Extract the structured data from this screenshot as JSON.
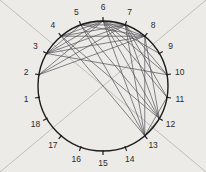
{
  "figure": {
    "title": "",
    "type": "circular-chord-diagram",
    "background_color": "#ecebe7",
    "circle": {
      "cx": 103,
      "cy": 86,
      "r": 65,
      "stroke": "#1c1c1c",
      "stroke_width": 1.4
    },
    "tick": {
      "length": 4,
      "stroke": "#1c1c1c",
      "stroke_width": 1.2
    },
    "label_radius": 78,
    "label_color": "#2a2a2a",
    "chord_color": "#4a4a52",
    "chord_width": 0.8,
    "guide_color": "#b9b8b4",
    "guide_width": 0.9,
    "node_count": 18
  },
  "chart_data": {
    "type": "scatter",
    "title": "",
    "xlabel": "",
    "ylabel": "",
    "nodes": [
      {
        "id": 1,
        "label": "1",
        "angle_deg": 190
      },
      {
        "id": 2,
        "label": "2",
        "angle_deg": 170
      },
      {
        "id": 3,
        "label": "3",
        "angle_deg": 150
      },
      {
        "id": 4,
        "label": "4",
        "angle_deg": 130
      },
      {
        "id": 5,
        "label": "5",
        "angle_deg": 110
      },
      {
        "id": 6,
        "label": "6",
        "angle_deg": 90
      },
      {
        "id": 7,
        "label": "7",
        "angle_deg": 70
      },
      {
        "id": 8,
        "label": "8",
        "angle_deg": 50
      },
      {
        "id": 9,
        "label": "9",
        "angle_deg": 30
      },
      {
        "id": 10,
        "label": "10",
        "angle_deg": 10
      },
      {
        "id": 11,
        "label": "11",
        "angle_deg": 350
      },
      {
        "id": 12,
        "label": "12",
        "angle_deg": 330
      },
      {
        "id": 13,
        "label": "13",
        "angle_deg": 310
      },
      {
        "id": 14,
        "label": "14",
        "angle_deg": 290
      },
      {
        "id": 15,
        "label": "15",
        "angle_deg": 270
      },
      {
        "id": 16,
        "label": "16",
        "angle_deg": 250
      },
      {
        "id": 17,
        "label": "17",
        "angle_deg": 230
      },
      {
        "id": 18,
        "label": "18",
        "angle_deg": 210
      }
    ],
    "edges": [
      [
        2,
        6
      ],
      [
        2,
        7
      ],
      [
        2,
        8
      ],
      [
        3,
        5
      ],
      [
        3,
        6
      ],
      [
        3,
        7
      ],
      [
        3,
        8
      ],
      [
        4,
        6
      ],
      [
        4,
        7
      ],
      [
        4,
        8
      ],
      [
        5,
        6
      ],
      [
        5,
        7
      ],
      [
        5,
        8
      ],
      [
        6,
        8
      ],
      [
        6,
        9
      ],
      [
        6,
        10
      ],
      [
        6,
        11
      ],
      [
        6,
        12
      ],
      [
        6,
        13
      ],
      [
        7,
        10
      ],
      [
        7,
        11
      ],
      [
        7,
        12
      ],
      [
        7,
        13
      ],
      [
        8,
        12
      ],
      [
        8,
        13
      ],
      [
        5,
        12
      ],
      [
        5,
        13
      ],
      [
        4,
        12
      ],
      [
        4,
        13
      ],
      [
        11,
        13
      ],
      [
        12,
        13
      ],
      [
        6,
        7
      ],
      [
        3,
        10
      ]
    ],
    "guides": [
      {
        "name": "diagonal-tl-br",
        "x1": 0,
        "y1": 0,
        "x2": 206,
        "y2": 172
      },
      {
        "name": "diagonal-tr-bl",
        "x1": 206,
        "y1": 0,
        "x2": 0,
        "y2": 172
      }
    ]
  }
}
